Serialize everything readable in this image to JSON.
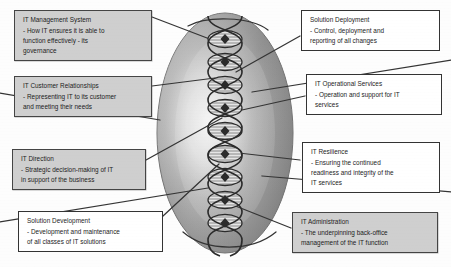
{
  "diagram": {
    "name": "IT capability model",
    "center_graphic": {
      "shape_name": "oval-with-dna-helix",
      "helix_node_count": 9,
      "oval_fill": "#8e8e8e",
      "oval_highlight": "#f0f0f0",
      "helix_stroke": "#2d2d2d"
    },
    "colors": {
      "box_shaded_fill": "#cfcfcf",
      "box_plain_fill": "#ffffff",
      "box_border": "#3c3c3c",
      "connector": "#333333",
      "text": "#1c1c1c"
    },
    "callouts": [
      {
        "id": "it-management-system",
        "title": "IT Management System",
        "desc": "- How IT ensures it is able to\nfunction effectively - its\ngovernance",
        "style": "shaded",
        "side": "left"
      },
      {
        "id": "it-customer-relationships",
        "title": "IT Customer Relationships",
        "desc": "- Representing IT to its customer\nand meeting their needs",
        "style": "shaded",
        "side": "left"
      },
      {
        "id": "it-direction",
        "title": "IT Direction",
        "desc": "- Strategic decision-making of IT\nin support of the business",
        "style": "shaded",
        "side": "left"
      },
      {
        "id": "solution-development",
        "title": "Solution Development",
        "desc": "- Development and maintenance\nof all classes of IT solutions",
        "style": "plain",
        "side": "left"
      },
      {
        "id": "solution-deployment",
        "title": "Solution Deployment",
        "desc": "- Control, deployment and\nreporting of all changes",
        "style": "plain",
        "side": "right"
      },
      {
        "id": "it-operational-services",
        "title": "IT Operational Services",
        "desc": "- Operation and support for IT\nservices",
        "style": "plain",
        "side": "right"
      },
      {
        "id": "it-resilience",
        "title": "IT Resilience",
        "desc": "- Ensuring the continued\nreadiness and integrity of the\nIT services",
        "style": "plain",
        "side": "right"
      },
      {
        "id": "it-administration",
        "title": "IT Administration",
        "desc": "- The underpinning back-office\nmanagement of the IT function",
        "style": "shaded",
        "side": "right"
      }
    ]
  }
}
